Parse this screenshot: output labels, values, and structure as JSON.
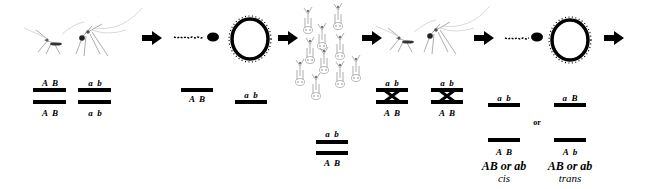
{
  "diagram": {
    "colors": {
      "ink": "#000000",
      "background": "#ffffff",
      "sketch": "#9a9a9a"
    },
    "stages": {
      "parents": {
        "icon": "mosquito-pair-icon",
        "chromosomes": [
          {
            "top_label": "A  B",
            "bottom_label": "A  B"
          },
          {
            "top_label": "a  b",
            "bottom_label": "a  b"
          }
        ]
      },
      "gametes": {
        "icons": [
          "sperm-icon",
          "egg-icon"
        ],
        "chromosomes": [
          {
            "label": "A  B"
          },
          {
            "label": "a  b"
          }
        ]
      },
      "f1_progeny": {
        "icon": "larvae-group-icon",
        "chromosome": {
          "top_label": "a  b",
          "bottom_label": "A  B"
        }
      },
      "f1_adults": {
        "icon": "mosquito-pair-icon",
        "crossover_chromosomes": [
          {
            "top_label": "a  b",
            "bottom_label": "A  B"
          },
          {
            "top_label": "a  b",
            "bottom_label": "A  B"
          }
        ]
      },
      "offspring": {
        "icons": [
          "sperm-icon",
          "egg-icon"
        ],
        "options": [
          {
            "top_label": "a  b",
            "bottom_label": "A  B",
            "caption": "AB or ab",
            "phase": "cis"
          },
          {
            "top_label": "a  B",
            "bottom_label": "A  b",
            "caption": "AB or ab",
            "phase": "trans"
          }
        ],
        "separator": "or"
      }
    },
    "arrows": 5
  }
}
